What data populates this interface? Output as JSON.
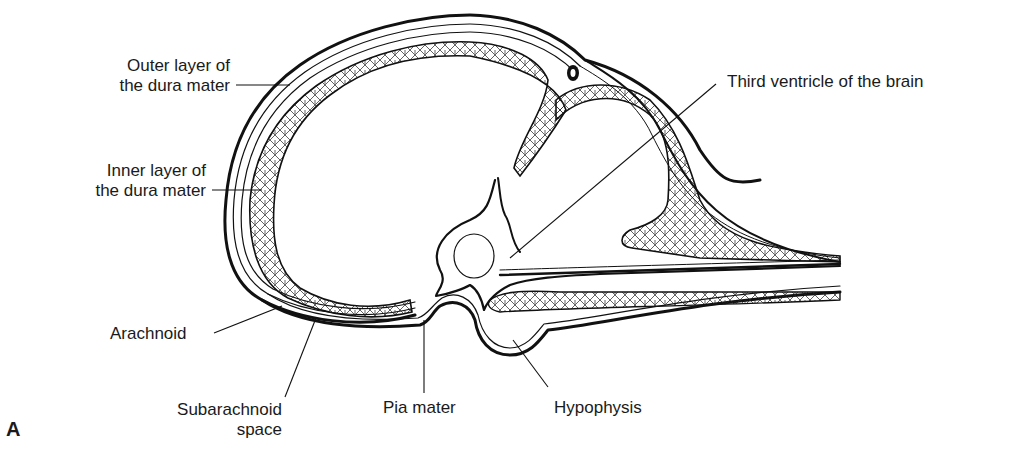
{
  "figure": {
    "panel_letter": "A",
    "labels": {
      "outer_dura": [
        "Outer layer of",
        "the dura mater"
      ],
      "inner_dura": [
        "Inner layer of",
        "the dura mater"
      ],
      "arachnoid": "Arachnoid",
      "subarachnoid": [
        "Subarachnoid",
        "space"
      ],
      "pia": "Pia mater",
      "hypophysis": "Hypophysis",
      "third_ventricle": "Third ventricle of the brain"
    },
    "colors": {
      "line": "#111111",
      "background": "#ffffff",
      "text": "#1a1a1a"
    }
  }
}
